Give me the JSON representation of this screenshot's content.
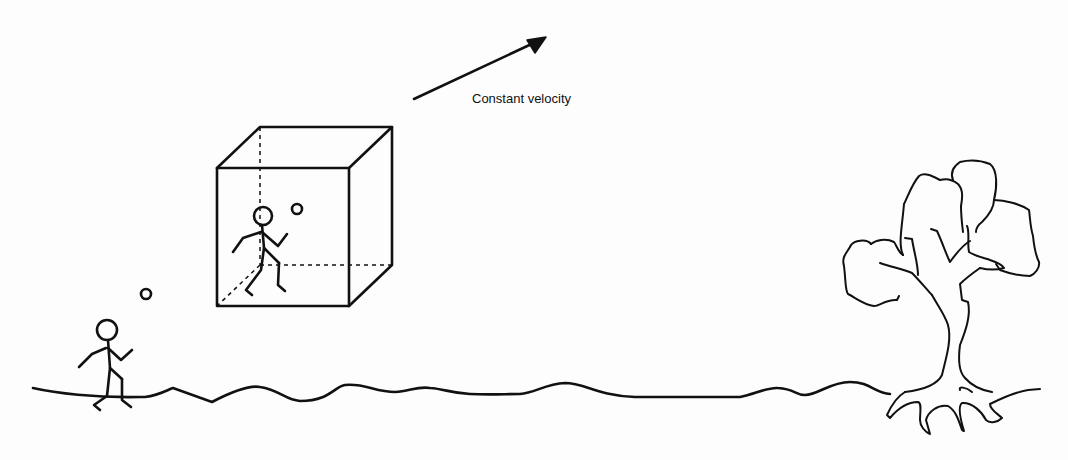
{
  "diagram": {
    "velocity_arrow": {
      "label": "Constant velocity"
    },
    "elements": [
      "ground-line",
      "stick-figure-outside",
      "ball-outside",
      "moving-cube",
      "stick-figure-inside",
      "ball-inside",
      "tree",
      "velocity-arrow"
    ],
    "colors": {
      "ink": "#111111",
      "background": "#fdfdfd"
    }
  }
}
